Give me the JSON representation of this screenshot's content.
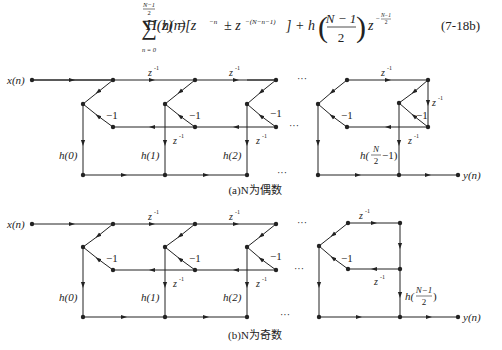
{
  "equation": {
    "lhs": "H(z) =",
    "sum_upper_num": "N−1",
    "sum_upper_den": "2",
    "sum_lower": "n = 0",
    "sigma": "∑",
    "term1": "h(n)[z",
    "exp1": "−n",
    "pm": "± z",
    "exp2": "−(N−n−1)",
    "bracket_close": "] + h",
    "frac_num": "N − 1",
    "frac_den": "2",
    "z_tail": "z",
    "exp3_num": "N−1",
    "exp3_den": "2",
    "exp3_sign": "−",
    "number": "(7-18b)"
  },
  "diagram_a": {
    "caption": "(a)N为偶数",
    "input_label": "x(n)",
    "output_label": "y(n)",
    "delay_label": "z",
    "delay_exp": "-1",
    "gain_label": "−1",
    "ellipsis": "···",
    "coefficients": [
      "h(0)",
      "h(1)",
      "h(2)"
    ],
    "last_coefficient_prefix": "h(",
    "last_coefficient_num": "N",
    "last_coefficient_den": "2",
    "last_coefficient_suffix": "−1)"
  },
  "diagram_b": {
    "caption": "(b)N为奇数",
    "input_label": "x(n)",
    "output_label": "y(n)",
    "delay_label": "z",
    "delay_exp": "-1",
    "gain_label": "−1",
    "ellipsis": "···",
    "coefficients": [
      "h(0)",
      "h(1)",
      "h(2)"
    ],
    "last_coefficient_prefix": "h(",
    "last_coefficient_num": "N−1",
    "last_coefficient_den": "2",
    "last_coefficient_suffix": ")"
  }
}
